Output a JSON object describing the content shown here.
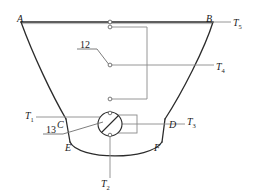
{
  "figure": {
    "type": "technical-schematic",
    "stroke_color": "#2b2b2b",
    "thin_stroke_color": "#8a8a8a",
    "background_color": "#ffffff"
  },
  "vertex_labels": [
    {
      "id": "A",
      "text": "A",
      "x": 17,
      "y": 14
    },
    {
      "id": "B",
      "text": "B",
      "x": 206,
      "y": 14
    },
    {
      "id": "C",
      "text": "C",
      "x": 57,
      "y": 120
    },
    {
      "id": "D",
      "text": "D",
      "x": 169,
      "y": 120
    },
    {
      "id": "E",
      "text": "E",
      "x": 65,
      "y": 143
    },
    {
      "id": "F",
      "text": "F",
      "x": 154,
      "y": 143
    }
  ],
  "temperature_labels": [
    {
      "id": "T5",
      "base": "T",
      "sub": "5",
      "x": 233,
      "y": 18
    },
    {
      "id": "T4",
      "base": "T",
      "sub": "4",
      "x": 216,
      "y": 62
    },
    {
      "id": "T1",
      "base": "T",
      "sub": "1",
      "x": 25,
      "y": 113
    },
    {
      "id": "T3",
      "base": "T",
      "sub": "3",
      "x": 187,
      "y": 117
    },
    {
      "id": "T2",
      "base": "T",
      "sub": "2",
      "x": 101,
      "y": 180
    }
  ],
  "callouts": [
    {
      "id": "callout-12",
      "text": "12",
      "x": 80,
      "y": 43
    },
    {
      "id": "callout-13",
      "text": "13",
      "x": 46,
      "y": 128
    }
  ],
  "components": {
    "valve": {
      "name": "valve-symbol",
      "cx": 110,
      "cy": 124,
      "r": 12
    },
    "valve_body": {
      "name": "valve-body-rect",
      "x": 110,
      "y": 115,
      "w": 27,
      "h": 18
    },
    "contacts": [
      {
        "name": "contact-upper-a",
        "cx": 110,
        "cy": 22
      },
      {
        "name": "contact-upper-b",
        "cx": 110,
        "cy": 27
      },
      {
        "name": "contact-middle",
        "cx": 110,
        "cy": 65
      },
      {
        "name": "contact-lower",
        "cx": 110,
        "cy": 99
      },
      {
        "name": "contact-valve-top",
        "cx": 110,
        "cy": 113
      },
      {
        "name": "contact-valve-bottom",
        "cx": 110,
        "cy": 135
      }
    ]
  },
  "geometry": {
    "top_rail": {
      "x1": 21,
      "y1": 22,
      "x2": 213,
      "y2": 22
    },
    "left_wall": "M21,22 C33,55 52,95 66,119",
    "right_wall": "M213,22 C205,48 182,93 165,119",
    "left_neck": {
      "x1": 66,
      "y1": 119,
      "x2": 70,
      "y2": 142
    },
    "right_neck": {
      "x1": 165,
      "y1": 119,
      "x2": 162,
      "y2": 142
    },
    "bottom_bowl": "M70,142 C78,160 150,161 162,142",
    "t5_lead": {
      "x1": 213,
      "y1": 22,
      "x2": 231,
      "y2": 22
    },
    "t4_lead": {
      "x1": 110,
      "y1": 65,
      "x2": 214,
      "y2": 65
    },
    "t1_lead": {
      "x1": 36,
      "y1": 117,
      "x2": 110,
      "y2": 117
    },
    "t3_lead": {
      "x1": 137,
      "y1": 124,
      "x2": 185,
      "y2": 124
    },
    "t2_lead": {
      "x1": 110,
      "y1": 124,
      "x2": 110,
      "y2": 178
    },
    "switch_wire": "M112,27 L147,27 L147,99 L112,99",
    "callout12_underline": {
      "x1": 77,
      "y1": 49,
      "x2": 97,
      "y2": 49
    },
    "callout12_leader": {
      "x1": 97,
      "y1": 49,
      "x2": 109,
      "y2": 64
    },
    "callout13_underline": {
      "x1": 43,
      "y1": 134,
      "x2": 63,
      "y2": 134
    },
    "callout13_leader": {
      "x1": 63,
      "y1": 134,
      "x2": 104,
      "y2": 122
    }
  }
}
